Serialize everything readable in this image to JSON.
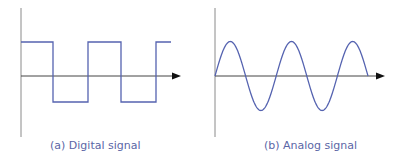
{
  "panels": [
    {
      "id": "a",
      "caption": "(a) Digital signal",
      "signal_type": "square"
    },
    {
      "id": "b",
      "caption": "(b) Analog signal",
      "signal_type": "sine"
    }
  ],
  "colors": {
    "signal": "#5563b0",
    "axis": "#555555",
    "arrow": "#111111",
    "caption": "#5b66a6"
  }
}
